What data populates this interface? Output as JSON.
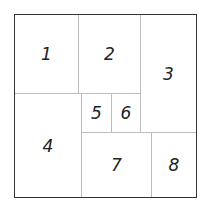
{
  "diagram": {
    "type": "rectangle-partition",
    "cells": [
      {
        "label": "1",
        "x": 14,
        "y": 14,
        "w": 64,
        "h": 79
      },
      {
        "label": "2",
        "x": 78,
        "y": 14,
        "w": 62,
        "h": 79
      },
      {
        "label": "3",
        "x": 140,
        "y": 14,
        "w": 57,
        "h": 118
      },
      {
        "label": "4",
        "x": 14,
        "y": 93,
        "w": 67,
        "h": 105
      },
      {
        "label": "5",
        "x": 81,
        "y": 93,
        "w": 30,
        "h": 39
      },
      {
        "label": "6",
        "x": 111,
        "y": 93,
        "w": 29,
        "h": 39
      },
      {
        "label": "7",
        "x": 81,
        "y": 132,
        "w": 70,
        "h": 66
      },
      {
        "label": "8",
        "x": 151,
        "y": 132,
        "w": 46,
        "h": 66
      }
    ]
  }
}
